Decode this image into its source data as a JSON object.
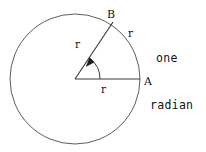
{
  "figure": {
    "background_color": "#ffffff",
    "stroke_color": "#4a4a4a",
    "text_color": "#141414"
  },
  "caption": {
    "line1": "one",
    "line2": "radian"
  },
  "points": {
    "a_label": "A",
    "b_label": "B"
  },
  "radius_labels": {
    "horizontal": "r",
    "slanted": "r",
    "arc": "r"
  },
  "geometry": {
    "center_x": 75,
    "center_y": 79,
    "radius": 65,
    "point_a_x": 140,
    "point_a_y": 79,
    "point_b_x": 113,
    "point_b_y": 22,
    "angle_degrees": 57.3
  }
}
